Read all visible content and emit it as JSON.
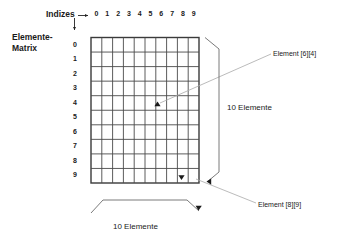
{
  "figure": {
    "title_label": "Indizes",
    "matrix_label_line1": "Elemente-",
    "matrix_label_line2": "Matrix",
    "column_indices": [
      "0",
      "1",
      "2",
      "3",
      "4",
      "5",
      "6",
      "7",
      "8",
      "9"
    ],
    "row_indices": [
      "0",
      "1",
      "2",
      "3",
      "4",
      "5",
      "6",
      "7",
      "8",
      "9"
    ],
    "grid": {
      "rows": 10,
      "cols": 10
    },
    "callouts": [
      {
        "id": "element-6-4",
        "label": "Element [6][4]",
        "target_row": 4,
        "target_col": 6
      },
      {
        "id": "element-8-9",
        "label": "Element [8][9]",
        "target_row": 9,
        "target_col": 8
      }
    ],
    "dimensions": {
      "vertical_label": "10 Elemente",
      "horizontal_label": "10 Elemente"
    },
    "colors": {
      "line": "#3a3a3a",
      "leader": "#9a9a9a",
      "text": "#1a1a1a",
      "background": "#ffffff"
    }
  }
}
